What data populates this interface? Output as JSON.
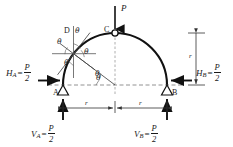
{
  "figure": {
    "type": "three-hinged-semicircular-arch-free-body-diagram",
    "points": {
      "A": "A",
      "B": "B",
      "C": "C",
      "D": "D"
    },
    "load": {
      "label": "P",
      "direction": "down",
      "applied_at": "C"
    },
    "angles": {
      "symbol": "θ",
      "count": 6,
      "labels": [
        "θ",
        "θ",
        "θ",
        "θ",
        "θ",
        "θ"
      ]
    },
    "dimensions": {
      "radius_label": "r",
      "left_span_label": "r",
      "right_span_label": "r",
      "height_label": "r"
    },
    "reactions": {
      "HA": {
        "symbol": "H",
        "sub": "A",
        "eq": "=",
        "num": "P",
        "den": "2"
      },
      "HB": {
        "symbol": "H",
        "sub": "B",
        "eq": "=",
        "num": "P",
        "den": "2"
      },
      "VA": {
        "symbol": "V",
        "sub": "A",
        "eq": "=",
        "num": "P",
        "den": "2"
      },
      "VB": {
        "symbol": "V",
        "sub": "B",
        "eq": "=",
        "num": "P",
        "den": "2"
      }
    },
    "colors": {
      "arch_stroke": "#111111",
      "thin_line": "#555555",
      "dashed_line": "#777777",
      "background": "#ffffff"
    }
  }
}
